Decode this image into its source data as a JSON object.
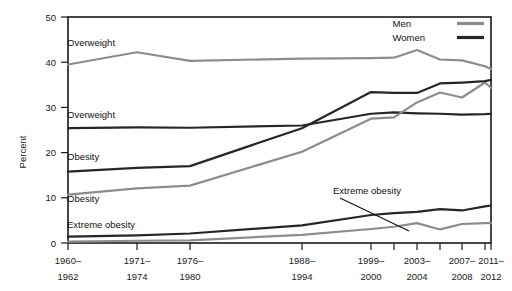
{
  "chart_data": {
    "type": "line",
    "title": "",
    "xlabel": "",
    "ylabel": "Percent",
    "ylim": [
      0,
      50
    ],
    "yticks": [
      0,
      10,
      20,
      30,
      40,
      50
    ],
    "ytick_labels": [
      "0",
      "10",
      "20",
      "30",
      "40",
      "50"
    ],
    "grid": false,
    "legend_position": "top-right",
    "categories": [
      "1960–1962",
      "1971–1974",
      "1976–1980",
      "1988–1994",
      "1999–2000",
      "2001–2002",
      "2003–2004",
      "2005–2006",
      "2007–2008",
      "2009–2010",
      "2011–2012"
    ],
    "xtick_labels": [
      {
        "line1": "1960–",
        "line2": "1962"
      },
      {
        "line1": "1971–",
        "line2": "1974"
      },
      {
        "line1": "1976–",
        "line2": "1980"
      },
      {
        "line1": "1988–",
        "line2": "1994"
      },
      {
        "line1": "1999–",
        "line2": "2000"
      },
      {
        "line1": "2003–",
        "line2": "2004"
      },
      {
        "line1": "2007–",
        "line2": "2008"
      },
      {
        "line1": "2011–",
        "line2": "2012"
      }
    ],
    "series": [
      {
        "name": "Overweight, Men",
        "sex": "Men",
        "condition": "Overweight",
        "color": "#8c8c8c",
        "values": [
          39.5,
          42.2,
          40.3,
          40.8,
          40.9,
          41.0,
          42.7,
          40.6,
          40.4,
          39.1,
          38.5
        ]
      },
      {
        "name": "Overweight, Women",
        "sex": "Women",
        "condition": "Overweight",
        "color": "#262626",
        "values": [
          25.4,
          25.6,
          25.5,
          26.0,
          28.6,
          28.9,
          28.7,
          28.6,
          28.4,
          28.5,
          28.6
        ]
      },
      {
        "name": "Obesity, Men",
        "sex": "Men",
        "condition": "Obesity",
        "color": "#8c8c8c",
        "values": [
          10.7,
          12.1,
          12.7,
          20.2,
          27.5,
          27.8,
          31.1,
          33.3,
          32.2,
          35.5,
          34.3
        ]
      },
      {
        "name": "Obesity, Women",
        "sex": "Women",
        "condition": "Obesity",
        "color": "#262626",
        "values": [
          15.8,
          16.6,
          17.0,
          25.4,
          33.4,
          33.2,
          33.2,
          35.3,
          35.5,
          35.8,
          36.1
        ]
      },
      {
        "name": "Extreme obesity, Men",
        "sex": "Men",
        "condition": "Extreme obesity",
        "color": "#8c8c8c",
        "values": [
          0.3,
          0.5,
          0.6,
          1.8,
          3.1,
          3.6,
          4.4,
          3.0,
          4.2,
          4.4,
          4.4
        ]
      },
      {
        "name": "Extreme obesity, Women",
        "sex": "Women",
        "condition": "Extreme obesity",
        "color": "#262626",
        "values": [
          1.4,
          1.7,
          2.1,
          3.9,
          6.2,
          6.6,
          6.9,
          7.5,
          7.2,
          8.1,
          8.3
        ]
      }
    ],
    "annotations": [
      {
        "text": "Overweight",
        "series": "Overweight, Men",
        "x": 67,
        "y": 46
      },
      {
        "text": "Overweight",
        "series": "Overweight, Women",
        "x": 67,
        "y": 118
      },
      {
        "text": "Obesity",
        "series": "Obesity, Women",
        "x": 67,
        "y": 160
      },
      {
        "text": "Obesity",
        "series": "Obesity, Men",
        "x": 67,
        "y": 202
      },
      {
        "text": "Extreme obesity",
        "series": "Extreme obesity, Women",
        "x": 67,
        "y": 228
      },
      {
        "text": "Extreme obesity",
        "series": "Extreme obesity, Men",
        "x": 333,
        "y": 194,
        "leader": true
      }
    ],
    "legend": [
      {
        "label": "Men",
        "color": "#8c8c8c"
      },
      {
        "label": "Women",
        "color": "#262626"
      }
    ]
  },
  "axis": {
    "ylabel": "Percent",
    "ytick_0": "0",
    "ytick_10": "10",
    "ytick_20": "20",
    "ytick_30": "30",
    "ytick_40": "40",
    "ytick_50": "50"
  },
  "xlabels": {
    "t0_a": "1960–",
    "t0_b": "1962",
    "t1_a": "1971–",
    "t1_b": "1974",
    "t2_a": "1976–",
    "t2_b": "1980",
    "t3_a": "1988–",
    "t3_b": "1994",
    "t4_a": "1999–",
    "t4_b": "2000",
    "t5_a": "2003–",
    "t5_b": "2004",
    "t6_a": "2007–",
    "t6_b": "2008",
    "t7_a": "2011–",
    "t7_b": "2012"
  },
  "labels": {
    "overweight_men": "Overweight",
    "overweight_women": "Overweight",
    "obesity_women": "Obesity",
    "obesity_men": "Obesity",
    "extreme_obesity_women": "Extreme obesity",
    "extreme_obesity_men": "Extreme obesity"
  },
  "legend": {
    "men": "Men",
    "women": "Women"
  }
}
